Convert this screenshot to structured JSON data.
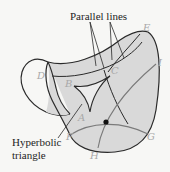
{
  "diagram": {
    "title_label": "Parallel lines",
    "triangle_label_line1": "Hyperbolic",
    "triangle_label_line2": "triangle",
    "points": {
      "A": "A",
      "B": "B",
      "C": "C",
      "D": "D",
      "E": "E",
      "F": "F",
      "G": "G",
      "H": "H",
      "I": "I"
    },
    "colors": {
      "background": "#f7f7f5",
      "surface_fill": "#d9d9d9",
      "outline": "#2a2a2a",
      "geodesic_gray": "#7a7a7a",
      "point_label": "#a8a8a8",
      "text": "#1e1e1e"
    },
    "surface": "saddle (hyperbolic paraboloid)",
    "marked_point": "intersection of FG and HI"
  }
}
